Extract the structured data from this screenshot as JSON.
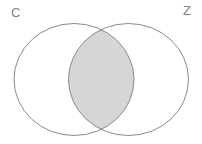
{
  "figure": {
    "type": "venn-diagram",
    "width": 202,
    "height": 144,
    "background_color": "#ffffff",
    "stroke_color": "#8a8a8a",
    "stroke_width": 1,
    "label_color": "#808080",
    "highlight_color": "#d6d6d6",
    "highlight_region": "intersection"
  },
  "sets": [
    {
      "label": "C",
      "name": "left-set",
      "circle": {
        "cx": 74,
        "cy": 79.5,
        "rx": 60,
        "ry": 56
      },
      "label_position": {
        "x": 11,
        "y": 6
      },
      "fill": "#ffffff"
    },
    {
      "label": "Z",
      "name": "right-set",
      "circle": {
        "cx": 128.5,
        "cy": 79.5,
        "rx": 60,
        "ry": 56
      },
      "label_position": {
        "x": 183,
        "y": 4
      },
      "fill": "#ffffff"
    }
  ],
  "intersection": {
    "name": "c-and-z",
    "shaded": true,
    "fill": "#d6d6d6",
    "top_node": {
      "x": 101.25,
      "y": 23.8
    },
    "bottom_node": {
      "x": 101.25,
      "y": 135.2
    }
  }
}
